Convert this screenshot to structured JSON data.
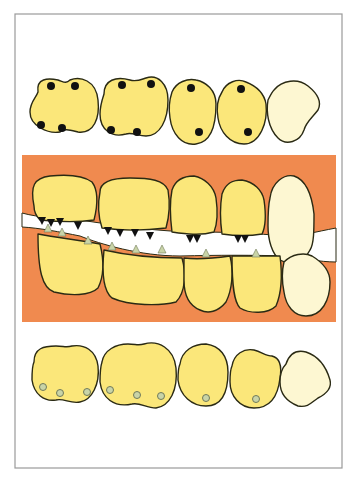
{
  "colors": {
    "background": "#ffffff",
    "frame": "#9a9a9a",
    "gum": "#f08a4f",
    "tooth": "#fbe77a",
    "tooth_light": "#fdf7d2",
    "outline": "#2a2a14",
    "dark_contact": "#111111",
    "light_contact_fill": "#c9d4a8",
    "light_contact_stroke": "#707a58",
    "gap": "#ffffff"
  },
  "diagram": {
    "upper_occlusal": {
      "teeth": [
        {
          "name": "upper-molar-1",
          "path": "M38,92 C36,78 48,78 58,80 C64,82 66,84 70,80 C80,76 96,80 98,100 C100,118 94,134 78,132 C70,130 64,128 60,132 C48,134 30,126 30,112 C30,102 36,98 38,92 Z",
          "light": false
        },
        {
          "name": "upper-molar-2",
          "path": "M104,94 C104,80 116,76 130,80 C136,82 140,80 146,78 C158,74 168,84 168,100 C168,120 160,136 146,136 C138,136 132,132 126,134 C112,138 100,130 100,114 C100,106 102,100 104,94 Z",
          "light": false
        },
        {
          "name": "upper-premolar-1",
          "path": "M172,92 C176,82 188,78 196,80 C206,82 216,90 216,104 C216,122 212,142 196,144 C182,146 172,134 170,118 C168,106 170,98 172,92 Z",
          "light": false
        },
        {
          "name": "upper-premolar-2",
          "path": "M222,92 C226,82 238,78 246,82 C256,86 264,92 266,104 C268,122 260,144 244,144 C230,144 220,132 218,118 C216,106 218,98 222,92 Z",
          "light": false
        },
        {
          "name": "upper-canine",
          "path": "M274,90 C282,80 298,78 308,86 C318,94 322,102 318,110 C312,118 306,122 304,130 C300,142 286,146 278,138 C268,128 266,112 268,100 C270,96 272,92 274,90 Z",
          "light": true
        }
      ],
      "dark_contacts": [
        [
          51,
          86
        ],
        [
          75,
          86
        ],
        [
          41,
          125
        ],
        [
          62,
          128
        ],
        [
          122,
          85
        ],
        [
          151,
          84
        ],
        [
          111,
          130
        ],
        [
          137,
          132
        ],
        [
          191,
          88
        ],
        [
          199,
          132
        ],
        [
          241,
          89
        ],
        [
          248,
          132
        ]
      ]
    },
    "lateral_view": {
      "gum_rect": {
        "x": 22,
        "y": 155,
        "width": 314,
        "height": 167
      },
      "gap_path": "M22,213 C40,218 60,218 80,220 C120,226 160,232 200,232 C240,232 270,235 290,236 C300,236 315,232 336,228 L336,262 C320,262 300,258 290,256 C250,255 220,255 180,256 C140,256 100,244 80,236 C60,232 40,228 22,227 Z",
      "upper_teeth": [
        {
          "name": "upper-molar-1-lateral",
          "path": "M34,206 C30,186 34,178 50,176 C70,174 84,176 92,182 C98,190 98,204 94,220 C80,222 60,222 40,220 C36,216 34,212 34,206 Z",
          "light": false
        },
        {
          "name": "upper-molar-2-lateral",
          "path": "M100,192 C100,182 110,178 130,178 C150,178 164,180 168,190 C170,202 170,214 166,228 C150,230 130,232 102,228 C98,216 98,202 100,192 Z",
          "light": false
        },
        {
          "name": "upper-premolar-1-lateral",
          "path": "M172,190 C176,178 186,176 194,176 C204,178 214,186 216,198 C218,212 218,222 214,232 C200,236 186,234 172,232 C170,216 170,200 172,190 Z",
          "light": false
        },
        {
          "name": "upper-premolar-2-lateral",
          "path": "M222,194 C226,182 234,180 242,180 C254,182 262,190 264,200 C266,214 266,226 262,234 C250,236 236,236 222,234 C220,220 220,206 222,194 Z",
          "light": false
        },
        {
          "name": "upper-canine-lateral",
          "path": "M270,198 C272,182 284,174 294,176 C306,180 312,196 314,214 C314,230 314,244 310,250 C304,262 290,266 280,260 C272,254 268,240 268,226 C268,214 268,206 270,198 Z",
          "light": true
        }
      ],
      "lower_teeth": [
        {
          "name": "lower-molar-1-lateral",
          "path": "M38,234 C58,238 80,240 100,244 C104,260 104,276 98,288 C90,296 70,296 54,292 C42,288 38,270 38,234 Z",
          "light": false
        },
        {
          "name": "lower-molar-2-lateral",
          "path": "M104,250 C130,256 160,258 182,258 C186,272 186,292 176,302 C160,306 130,306 112,298 C102,290 102,270 104,250 Z",
          "light": false
        },
        {
          "name": "lower-premolar-1-lateral",
          "path": "M184,258 C200,260 216,258 230,256 C234,272 232,290 226,302 C218,312 208,314 200,310 C190,306 184,296 184,280 C184,272 184,264 184,258 Z",
          "light": false
        },
        {
          "name": "lower-premolar-2-lateral",
          "path": "M232,256 C248,256 264,256 280,256 C282,272 282,292 276,306 C268,314 250,314 240,308 C234,302 232,286 232,256 Z",
          "light": false
        },
        {
          "name": "lower-canine-lateral",
          "path": "M284,262 C292,254 304,252 312,256 C322,262 330,270 330,282 C330,300 322,316 306,316 C294,316 286,306 284,292 C282,282 282,270 284,262 Z",
          "light": true
        }
      ],
      "dark_contacts": [
        [
          42,
          221
        ],
        [
          51,
          223
        ],
        [
          60,
          222
        ],
        [
          78,
          226
        ],
        [
          108,
          231
        ],
        [
          120,
          233
        ],
        [
          135,
          233
        ],
        [
          150,
          236
        ],
        [
          190,
          239
        ],
        [
          197,
          239
        ],
        [
          238,
          239
        ],
        [
          245,
          239
        ]
      ],
      "light_contacts": [
        [
          48,
          228
        ],
        [
          62,
          232
        ],
        [
          88,
          240
        ],
        [
          112,
          246
        ],
        [
          136,
          249
        ],
        [
          162,
          249
        ],
        [
          206,
          253
        ],
        [
          256,
          253
        ]
      ]
    },
    "lower_occlusal": {
      "teeth": [
        {
          "name": "lower-molar-1",
          "path": "M34,362 C34,348 44,346 56,346 C64,346 66,348 72,346 C84,344 96,350 98,366 C100,384 92,400 80,402 C70,404 64,398 56,400 C44,402 34,394 32,380 C32,372 32,366 34,362 Z",
          "light": false
        },
        {
          "name": "lower-molar-2",
          "path": "M102,362 C104,350 116,344 128,344 C136,344 138,346 144,344 C158,340 174,348 176,368 C178,390 170,406 156,408 C146,408 140,402 132,404 C114,408 102,398 100,382 C100,374 100,368 102,362 Z",
          "light": false
        },
        {
          "name": "lower-premolar-1",
          "path": "M180,364 C182,350 194,344 206,344 C220,346 228,356 228,372 C228,392 222,406 206,406 C192,406 180,396 178,380 C178,374 178,368 180,364 Z",
          "light": false
        },
        {
          "name": "lower-premolar-2",
          "path": "M232,366 C234,354 244,348 254,350 C262,352 266,356 272,356 C280,358 282,366 280,378 C278,396 270,408 254,408 C240,408 230,396 230,382 C230,376 230,370 232,366 Z",
          "light": false
        },
        {
          "name": "lower-canine",
          "path": "M286,364 C290,352 298,350 306,352 C318,356 326,366 330,380 C332,388 326,394 318,398 C312,402 308,408 298,406 C288,402 280,394 280,382 C280,374 282,368 286,364 Z",
          "light": true
        }
      ],
      "light_contacts": [
        [
          43,
          387
        ],
        [
          60,
          393
        ],
        [
          87,
          392
        ],
        [
          110,
          390
        ],
        [
          137,
          395
        ],
        [
          161,
          396
        ],
        [
          206,
          398
        ],
        [
          256,
          399
        ]
      ]
    }
  }
}
